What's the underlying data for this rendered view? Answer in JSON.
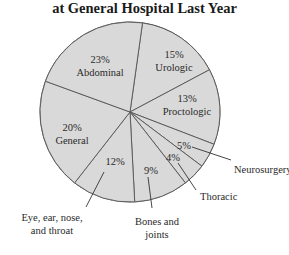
{
  "chart_data": {
    "type": "pie",
    "title": "at General Hospital Last Year",
    "unit": "%",
    "slices": [
      {
        "label": "Urologic",
        "value": 15,
        "start": 8,
        "end": 62,
        "pct_label": "15%",
        "label_pos": [
          174,
          58
        ],
        "inside": true
      },
      {
        "label": "Proctologic",
        "value": 13,
        "start": 62,
        "end": 111,
        "pct_label": "13%",
        "label_pos": [
          187,
          102
        ],
        "inside": true
      },
      {
        "label": "Neurosurgery",
        "value": 5,
        "start": 111,
        "end": 127,
        "pct_label": "5%",
        "label_pos": [
          184,
          149
        ],
        "inside": false,
        "ext_label_pos": [
          234,
          173
        ],
        "leader": [
          [
            192,
            147
          ],
          [
            231,
            160
          ]
        ]
      },
      {
        "label": "Thoracic",
        "value": 4,
        "start": 127,
        "end": 142,
        "pct_label": "4%",
        "label_pos": [
          173,
          161
        ],
        "inside": false,
        "ext_label_pos": [
          200,
          200
        ],
        "leader": [
          [
            178,
            163
          ],
          [
            196,
            190
          ]
        ]
      },
      {
        "label": "Bones and joints",
        "value": 9,
        "start": 142,
        "end": 177,
        "pct_label": "9%",
        "label_pos": [
          151,
          174
        ],
        "inside": false,
        "ext_label_lines": [
          "Bones and",
          "joints"
        ],
        "ext_label_pos": [
          157,
          225
        ],
        "leader": [
          [
            148,
            177
          ],
          [
            152,
            208
          ]
        ]
      },
      {
        "label": "Eye, ear, nose, and throat",
        "value": 12,
        "start": 177,
        "end": 218,
        "pct_label": "12%",
        "label_pos": [
          115,
          165
        ],
        "inside": false,
        "ext_label_lines": [
          "Eye, ear, nose,",
          "and throat"
        ],
        "ext_label_pos": [
          52,
          221
        ],
        "leader": [
          [
            104,
            172
          ],
          [
            86,
            207
          ]
        ]
      },
      {
        "label": "General",
        "value": 20,
        "start": 218,
        "end": 290,
        "pct_label": "20%",
        "label_pos": [
          72,
          131
        ],
        "inside": true
      },
      {
        "label": "Abdominal",
        "value": 23,
        "start": 290,
        "end": 368,
        "pct_label": "23%",
        "label_pos": [
          100,
          63
        ],
        "inside": true
      }
    ],
    "colors": {
      "fill": "#d9d9d9",
      "stroke": "#555555",
      "text": "#2a2a2a"
    },
    "center": [
      130,
      112
    ],
    "radius": 90,
    "legend": "none (labels on/next to slices)"
  }
}
